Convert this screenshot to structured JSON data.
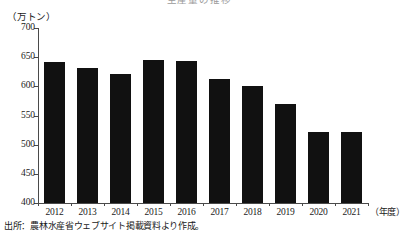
{
  "chart_data": {
    "type": "bar",
    "title": "",
    "categories": [
      "2012",
      "2013",
      "2014",
      "2015",
      "2016",
      "2017",
      "2018",
      "2019",
      "2020",
      "2021"
    ],
    "values": [
      642,
      632,
      621,
      646,
      643,
      612,
      600,
      570,
      522,
      522
    ],
    "xlabel": "（年度）",
    "ylabel": "（万トン）",
    "ylim": [
      400,
      700
    ],
    "yticks": [
      400,
      450,
      500,
      550,
      600,
      650,
      700
    ],
    "ytick_labels": [
      "400",
      "450",
      "500",
      "550",
      "600",
      "650",
      "700"
    ],
    "grid": false,
    "legend": false,
    "bar_color": "#111111",
    "axis_color": "#4a4a4a"
  },
  "figure": {
    "unit_label": "（万トン）",
    "x_axis_unit": "（年度）",
    "source_note": "出所：農林水産省ウェブサイト掲載資料より作成。",
    "title_remnant": "生産量の推移"
  }
}
